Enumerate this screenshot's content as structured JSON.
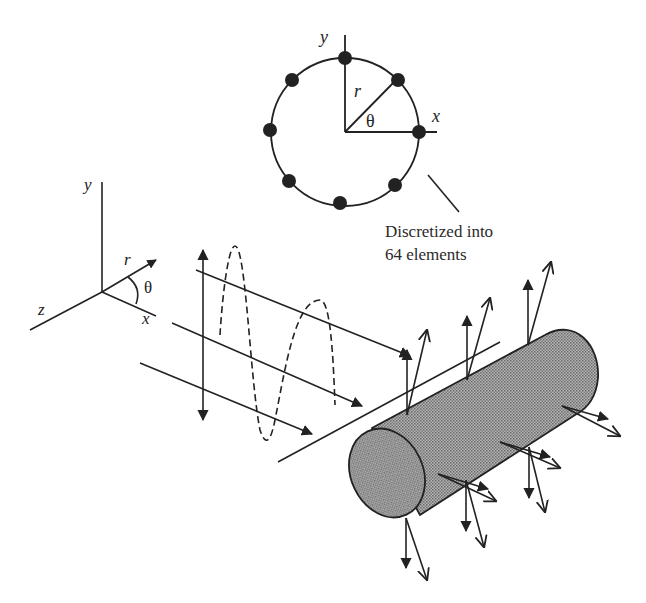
{
  "figure": {
    "type": "scattering-diagram",
    "background": "#ffffff",
    "stroke_color": "#222222",
    "fill_texture_color": "#8a8a8a"
  },
  "cross_section": {
    "axis_y_label": "y",
    "axis_x_label": "x",
    "radius_label": "r",
    "angle_label": "θ",
    "node_count_shown": 8
  },
  "annotation": {
    "line1": "Discretized into",
    "line2": "64 elements"
  },
  "coordinate_system": {
    "y_label": "y",
    "z_label": "z",
    "x_label": "x",
    "r_label": "r",
    "theta_label": "θ"
  },
  "incident_wave": {
    "polarization": "vertical double arrow",
    "wave_style": "dashed sinusoid",
    "ray_count": 3
  },
  "cylinder": {
    "shading": "stippled gray",
    "surface_vector_pairs": 8
  }
}
